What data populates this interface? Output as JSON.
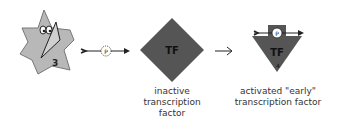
{
  "diagram": {
    "kinase": {
      "number": "3",
      "icon": "star-kinase-with-knife"
    },
    "phosphate": {
      "label": "P"
    },
    "inactive_tf": {
      "label": "TF",
      "caption_line1": "inactive",
      "caption_line2": "transcription factor"
    },
    "active_tf": {
      "label": "TF",
      "number": "4",
      "phosphate_label": "P",
      "caption_line1": "activated \"early\"",
      "caption_line2": "transcription factor"
    },
    "colors": {
      "tf_fill": "#555555",
      "kinase_fill": "#b8b8b8"
    }
  }
}
